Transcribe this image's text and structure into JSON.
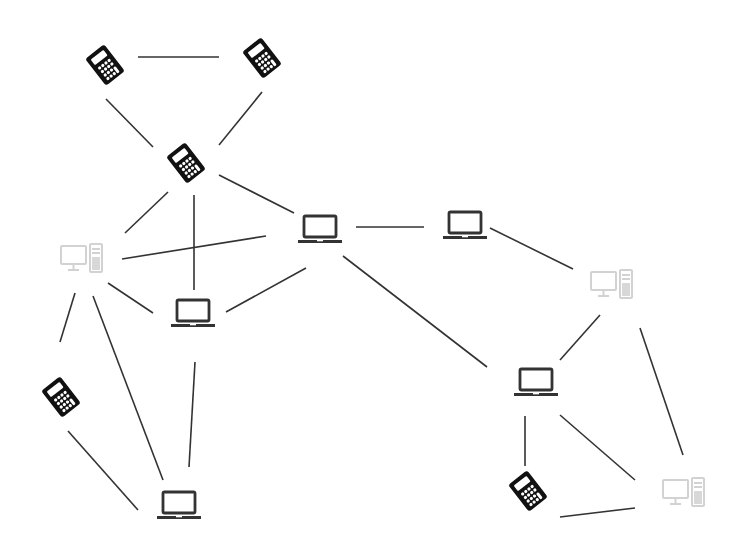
{
  "diagram": {
    "type": "network-topology",
    "colors": {
      "line": "#333333",
      "calculator": "#111111",
      "laptop": "#333333",
      "desktop": "#d4d4d4",
      "background": "#ffffff"
    },
    "nodes": [
      {
        "id": "c1",
        "kind": "calculator",
        "x": 105,
        "y": 65
      },
      {
        "id": "c2",
        "kind": "calculator",
        "x": 262,
        "y": 58
      },
      {
        "id": "c3",
        "kind": "calculator",
        "x": 186,
        "y": 163
      },
      {
        "id": "d1",
        "kind": "desktop",
        "x": 82,
        "y": 258
      },
      {
        "id": "l1",
        "kind": "laptop",
        "x": 320,
        "y": 230
      },
      {
        "id": "l2",
        "kind": "laptop",
        "x": 465,
        "y": 226
      },
      {
        "id": "d2",
        "kind": "desktop",
        "x": 612,
        "y": 284
      },
      {
        "id": "l3",
        "kind": "laptop",
        "x": 193,
        "y": 314
      },
      {
        "id": "l4",
        "kind": "laptop",
        "x": 536,
        "y": 383
      },
      {
        "id": "c4",
        "kind": "calculator",
        "x": 61,
        "y": 397
      },
      {
        "id": "l5",
        "kind": "laptop",
        "x": 179,
        "y": 506
      },
      {
        "id": "c5",
        "kind": "calculator",
        "x": 528,
        "y": 491
      },
      {
        "id": "d3",
        "kind": "desktop",
        "x": 684,
        "y": 492
      }
    ],
    "edges": [
      {
        "x1": 138,
        "y1": 57,
        "x2": 219,
        "y2": 57
      },
      {
        "x1": 106,
        "y1": 99,
        "x2": 153,
        "y2": 147
      },
      {
        "x1": 262,
        "y1": 92,
        "x2": 219,
        "y2": 145
      },
      {
        "x1": 168,
        "y1": 192,
        "x2": 125,
        "y2": 233
      },
      {
        "x1": 194,
        "y1": 195,
        "x2": 194,
        "y2": 290
      },
      {
        "x1": 219,
        "y1": 175,
        "x2": 294,
        "y2": 213
      },
      {
        "x1": 122,
        "y1": 259,
        "x2": 266,
        "y2": 236
      },
      {
        "x1": 108,
        "y1": 283,
        "x2": 153,
        "y2": 313
      },
      {
        "x1": 226,
        "y1": 312,
        "x2": 306,
        "y2": 268
      },
      {
        "x1": 356,
        "y1": 227,
        "x2": 424,
        "y2": 227
      },
      {
        "x1": 343,
        "y1": 256,
        "x2": 487,
        "y2": 367
      },
      {
        "x1": 490,
        "y1": 228,
        "x2": 573,
        "y2": 269
      },
      {
        "x1": 75,
        "y1": 293,
        "x2": 60,
        "y2": 342
      },
      {
        "x1": 93,
        "y1": 296,
        "x2": 163,
        "y2": 480
      },
      {
        "x1": 195,
        "y1": 362,
        "x2": 189,
        "y2": 467
      },
      {
        "x1": 68,
        "y1": 431,
        "x2": 138,
        "y2": 510
      },
      {
        "x1": 600,
        "y1": 315,
        "x2": 560,
        "y2": 360
      },
      {
        "x1": 640,
        "y1": 328,
        "x2": 683,
        "y2": 455
      },
      {
        "x1": 525,
        "y1": 416,
        "x2": 525,
        "y2": 466
      },
      {
        "x1": 560,
        "y1": 415,
        "x2": 635,
        "y2": 480
      },
      {
        "x1": 560,
        "y1": 517,
        "x2": 635,
        "y2": 508
      }
    ]
  }
}
